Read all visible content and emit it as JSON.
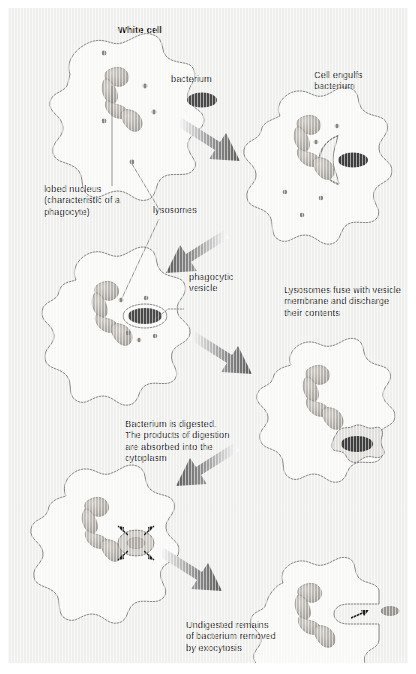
{
  "figure": {
    "type": "process-diagram",
    "background_color": "#f2f2f0",
    "ink_color": "#2b2b2b",
    "nucleus_color": "#b9b6b0",
    "bacterium_color": "#4a4a4a",
    "arrow_color": "#6e6e6e"
  },
  "labels": {
    "white_cell": "White cell",
    "bacterium": "bacterium",
    "cell_engulfs": "Cell engulfs\nbacterium",
    "lobed_nucleus": "lobed nucleus\n(characteristic of a\nphagocyte)",
    "lysosomes": "lysosomes",
    "phagocytic_vesicle": "phagocytic\nvesicle",
    "lysosomes_fuse": "Lysosomes fuse with vesicle\nmembrane and discharge\ntheir contents",
    "bacterium_digested": "Bacterium is digested.\nThe products of digestion\nare absorbed into the\ncytoplasm",
    "undigested_remains": "Undigested remains\nof bacterium removed\nby exocytosis"
  },
  "stages": [
    {
      "id": 1,
      "name": "white-cell-and-bacterium",
      "caption": "White cell"
    },
    {
      "id": 2,
      "name": "cell-engulfs-bacterium",
      "caption": "Cell engulfs bacterium"
    },
    {
      "id": 3,
      "name": "phagocytic-vesicle-formed",
      "caption": "phagocytic vesicle"
    },
    {
      "id": 4,
      "name": "lysosomes-fuse-with-vesicle",
      "caption": "Lysosomes fuse with vesicle membrane and discharge their contents"
    },
    {
      "id": 5,
      "name": "bacterium-digested",
      "caption": "Bacterium is digested. The products of digestion are absorbed into the cytoplasm"
    },
    {
      "id": 6,
      "name": "exocytosis-of-remains",
      "caption": "Undigested remains of bacterium removed by exocytosis"
    }
  ]
}
